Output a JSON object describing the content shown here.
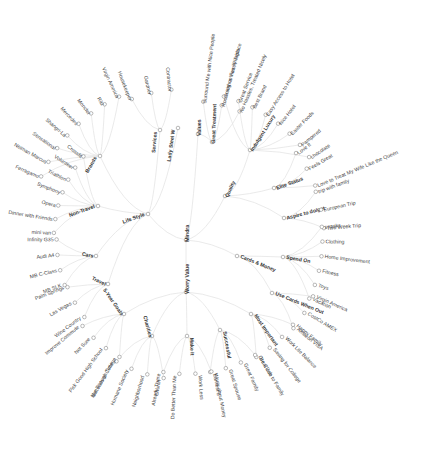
{
  "diagram": {
    "root": {
      "label": "Mindra",
      "x": 186,
      "y": 240
    },
    "accent_colors": {
      "link": "#e4e4e4",
      "node_stroke": "#8a8a8a",
      "text": "#444444"
    },
    "branches": [
      {
        "label": "Life Style",
        "x": 148,
        "y": 214,
        "angle": 20,
        "children": [
          {
            "label": "Brands",
            "x": 100,
            "y": 156,
            "angle": 60,
            "children": [
              "Ferragamo",
              "Neiman Marcus",
              "Sensational",
              "Shangri-La",
              "Mercedes",
              "Moncler",
              "Ritz",
              "Virgin America"
            ]
          },
          {
            "label": "Non-Travel",
            "x": 98,
            "y": 206,
            "angle": 20,
            "children": [
              "mini van",
              "Dinner with Friends",
              "Opera",
              "Symphony",
              "Triathlon",
              "Volunteer",
              "Crossfit"
            ]
          },
          {
            "label": "Cars",
            "x": 96,
            "y": 256,
            "angle": -12,
            "children": [
              "MB SLK",
              "MB C-Class",
              "Audi A4",
              "Infinity G35"
            ]
          },
          {
            "label": "Travel",
            "x": 108,
            "y": 284,
            "angle": -25,
            "children": [
              "Wine Country",
              "Las Vegas",
              "Palm Springs"
            ]
          },
          {
            "label": "Services",
            "x": 160,
            "y": 130,
            "angle": 85,
            "children": [
              "Housekeeper",
              "Gardner",
              "Contractor"
            ]
          },
          {
            "label": "Lady Steel W",
            "x": 178,
            "y": 128,
            "angle": 82,
            "children": []
          }
        ]
      },
      {
        "label": "Values",
        "x": 198,
        "y": 134,
        "angle": 90,
        "children": [
          {
            "label": "Great Treatment",
            "x": 212,
            "y": 142,
            "angle": 88,
            "children": [
              "Surround Me with Nice People",
              "Room with a View, Fireplace",
              "No Hassles, Treated Nicely"
            ]
          }
        ]
      },
      {
        "label": "Quality",
        "x": 225,
        "y": 196,
        "angle": 65,
        "children": [
          {
            "label": "Indulgent Luxury",
            "x": 250,
            "y": 150,
            "angle": 58,
            "children": [
              "Going on Family Trips",
              "Great Service",
              "Best Brand",
              "Easy Access to Hotel",
              "Nice Hotel",
              "Easter Foods",
              "Pampered",
              "chocolate"
            ]
          },
          {
            "label": "Elite Status",
            "x": 274,
            "y": 188,
            "angle": 20,
            "children": [
              "Love It",
              "Feels Great",
              "Love to Treat My Wife Like the Queen"
            ]
          },
          {
            "label": "Aspire to do/get",
            "x": 284,
            "y": 218,
            "angle": 15,
            "children": [
              "trip with family",
              "European Trip",
              "Two Week Trip"
            ]
          }
        ]
      },
      {
        "label": "Cards & Money",
        "x": 237,
        "y": 256,
        "angle": -22,
        "children": [
          {
            "label": "Spend On",
            "x": 283,
            "y": 257,
            "angle": -10,
            "children": [
              "snacks",
              "Clothing",
              "Home Improvement",
              "Fitness",
              "Toys",
              "Vacation"
            ]
          },
          {
            "label": "Use Cards When Out",
            "x": 272,
            "y": 293,
            "angle": -22,
            "children": [
              "Virgin America",
              "CostCo AMEX",
              "Amazon VISA"
            ]
          }
        ]
      },
      {
        "label": "Worry Value",
        "x": 186,
        "y": 292,
        "angle": 90,
        "children": [
          {
            "label": "Most Important",
            "x": 251,
            "y": 314,
            "angle": -55,
            "children": [
              "Happy Family",
              "Work Life Balance",
              "Saving for College",
              "Be Close to Family"
            ]
          },
          {
            "label": "Successful",
            "x": 220,
            "y": 330,
            "angle": -80,
            "children": [
              "Great Job",
              "Great Family",
              "Great Spouse",
              "Earnest E"
            ]
          },
          {
            "label": "Make It",
            "x": 187,
            "y": 336,
            "angle": -88,
            "children": [
              "Worry about Money",
              "Work Less",
              "Do Better Than Me",
              "Already There"
            ]
          },
          {
            "label": "Charities",
            "x": 152,
            "y": 336,
            "angle": -75,
            "children": [
              "Church",
              "Neighborhood",
              "Humane Society",
              "Not Enough Time"
            ]
          },
          {
            "label": "5-Year Goals",
            "x": 124,
            "y": 314,
            "angle": -55,
            "children": [
              "Get Kids to College",
              "Pick Good High School",
              "Not Sure",
              "Improve Commute"
            ]
          }
        ]
      }
    ]
  }
}
